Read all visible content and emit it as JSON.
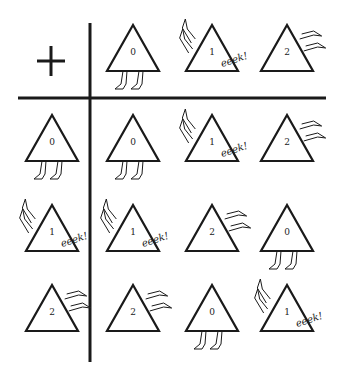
{
  "table": {
    "operator": "+",
    "operator_icon": "plus-icon",
    "header": [
      "0",
      "1",
      "2"
    ],
    "rows": [
      {
        "label": "0",
        "cells": [
          "0",
          "1",
          "2"
        ]
      },
      {
        "label": "1",
        "cells": [
          "1",
          "2",
          "0"
        ]
      },
      {
        "label": "2",
        "cells": [
          "2",
          "0",
          "1"
        ]
      }
    ],
    "exclamation": "eeek!"
  },
  "layout": {
    "line_color": "#1a1a1a",
    "col_x": [
      52,
      133,
      212,
      287
    ],
    "header_y": 25,
    "row_y": [
      115,
      205,
      285
    ]
  }
}
